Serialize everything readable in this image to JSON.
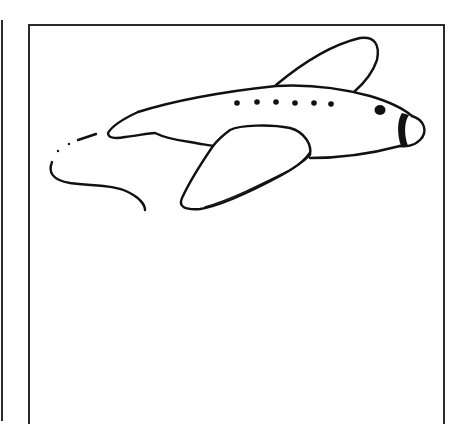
{
  "illustration": {
    "subject": "airplane",
    "style": "black line drawing on white",
    "elements": [
      "fuselage",
      "upper-wing",
      "lower-wing",
      "tail-fin",
      "window-dots",
      "cockpit-window",
      "nose-band",
      "motion-trail"
    ],
    "window_count": 6
  },
  "colors": {
    "ink": "#111111",
    "background": "#ffffff",
    "frame": "#2a2a2a"
  }
}
